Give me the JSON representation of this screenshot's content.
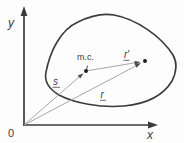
{
  "figure": {
    "background": "#fdfdfd",
    "colors": {
      "axis": "#3b3b3b",
      "body_outline": "#3b3b3b",
      "vector_line": "#9c9c9c",
      "arrowhead": "#4a4a4a",
      "point": "#222222",
      "label": "#3b3b3b"
    },
    "labels": {
      "y_axis": "y",
      "x_axis": "x",
      "origin": "0",
      "vector_s": "s",
      "vector_r": "r",
      "vector_r_prime": "r′",
      "mass_center": "m.c."
    }
  }
}
